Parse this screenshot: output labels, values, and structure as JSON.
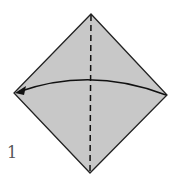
{
  "diagram": {
    "type": "origami-fold-step",
    "step_number": "1",
    "paper_color": "#c8c8c8",
    "outline_color": "#222222",
    "shape": "square-diamond",
    "vertices": {
      "top": [
        91,
        14
      ],
      "left": [
        14,
        93
      ],
      "right": [
        167,
        95
      ],
      "bottom": [
        90,
        173
      ]
    },
    "fold_line": {
      "style": "dashed",
      "from": "top",
      "to": "bottom",
      "kind": "valley-fold"
    },
    "arrow": {
      "from": "right",
      "to": "left",
      "style": "curved",
      "meaning": "fold right corner to left corner"
    }
  }
}
